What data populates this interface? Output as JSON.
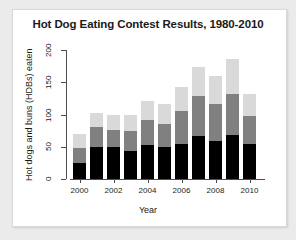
{
  "chart_data": {
    "type": "bar",
    "stacked": true,
    "title": "Hot Dog Eating Contest Results, 1980-2010",
    "xlabel": "Year",
    "ylabel": "Hot dogs and buns (HDBs) eaten",
    "grid": false,
    "legend": "none",
    "xlim": [
      1999.4,
      2010.6
    ],
    "ylim": [
      0,
      200
    ],
    "ytick_labels": [
      "0",
      "50",
      "100",
      "150",
      "200"
    ],
    "ytick_values": [
      0,
      50,
      100,
      150,
      200
    ],
    "xtick_labels": [
      "2000",
      "2002",
      "2004",
      "2006",
      "2008",
      "2010"
    ],
    "xtick_values": [
      2000,
      2002,
      2004,
      2006,
      2008,
      2010
    ],
    "categories": [
      2000,
      2001,
      2002,
      2003,
      2004,
      2005,
      2006,
      2007,
      2008,
      2009,
      2010
    ],
    "series": [
      {
        "name": "winner",
        "color": "#000000",
        "values": [
          25,
          50,
          50,
          44,
          53,
          49,
          54,
          66,
          59,
          68,
          54
        ]
      },
      {
        "name": "runner-up",
        "color": "#808080",
        "values": [
          23,
          31,
          26,
          30,
          39,
          37,
          52,
          62,
          58,
          64,
          43
        ]
      },
      {
        "name": "third-place",
        "color": "#d9d9d9",
        "values": [
          22,
          22,
          24,
          25,
          29,
          30,
          36,
          46,
          43,
          54,
          35
        ]
      }
    ],
    "cumulative_totals": [
      70,
      103,
      100,
      99,
      121,
      116,
      142,
      174,
      160,
      186,
      132
    ]
  }
}
